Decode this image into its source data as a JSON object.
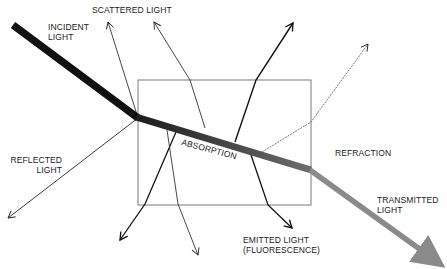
{
  "diagram": {
    "type": "light-matter interaction",
    "labels": {
      "incident": [
        "INCIDENT",
        "LIGHT"
      ],
      "scattered": "SCATTERED LIGHT",
      "reflected": [
        "REFLECTED",
        "LIGHT"
      ],
      "absorption": "ABSORPTION",
      "refraction": "REFRACTION",
      "emitted": [
        "EMITTED LIGHT",
        "(FLUORESCENCE)"
      ],
      "transmitted": [
        "TRANSMITTED",
        "LIGHT"
      ]
    },
    "colors": {
      "incident_beam": "#111111",
      "absorbed_beam_start": "#222222",
      "absorbed_beam_end": "#777777",
      "transmitted_beam": "#8a8a8a",
      "box_outline": "#777777",
      "thin_lines": "#333333"
    }
  }
}
